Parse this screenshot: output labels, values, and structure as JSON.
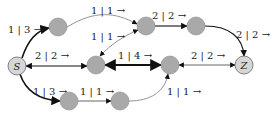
{
  "diagram": {
    "nodes": [
      {
        "id": "S",
        "label": "S",
        "x": 17,
        "y": 66,
        "fill": "#d6d6d6"
      },
      {
        "id": "A",
        "label": "",
        "x": 58,
        "y": 27,
        "fill": "#a9a9a9"
      },
      {
        "id": "B",
        "label": "",
        "x": 146,
        "y": 26,
        "fill": "#a9a9a9"
      },
      {
        "id": "C",
        "label": "",
        "x": 196,
        "y": 26,
        "fill": "#a9a9a9"
      },
      {
        "id": "M1",
        "label": "",
        "x": 96,
        "y": 65,
        "fill": "#a9a9a9"
      },
      {
        "id": "M2",
        "label": "",
        "x": 170,
        "y": 65,
        "fill": "#a9a9a9"
      },
      {
        "id": "Z",
        "label": "Z",
        "x": 244,
        "y": 65,
        "fill": "#d6d6d6"
      },
      {
        "id": "L1",
        "label": "",
        "x": 69,
        "y": 101,
        "fill": "#a9a9a9"
      },
      {
        "id": "L2",
        "label": "",
        "x": 120,
        "y": 101,
        "fill": "#a9a9a9"
      }
    ],
    "edges": [
      {
        "from": "S",
        "to": "A",
        "label": "1 | 3 →"
      },
      {
        "from": "A",
        "to": "B",
        "label": "1 | 1 →"
      },
      {
        "from": "B",
        "to": "C",
        "label": "2 | 2 →"
      },
      {
        "from": "C",
        "to": "Z",
        "label": "2 | 2 →"
      },
      {
        "from": "M1",
        "to": "B",
        "label": "1 | 1 →"
      },
      {
        "from": "M1",
        "to": "S",
        "label": "2 | 2 →"
      },
      {
        "from": "M1",
        "to": "M2",
        "label": "1 | 4 →"
      },
      {
        "from": "Z",
        "to": "M2",
        "label": "2 | 2 →"
      },
      {
        "from": "S",
        "to": "L1",
        "label": "1 | 3 →"
      },
      {
        "from": "L1",
        "to": "L2",
        "label": "1 | 1 →"
      },
      {
        "from": "L2",
        "to": "M2",
        "label": "1 | 1 →"
      }
    ]
  }
}
